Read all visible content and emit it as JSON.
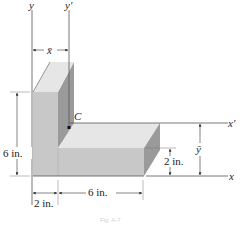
{
  "diagram": {
    "type": "L-shaped composite block centroid figure",
    "axes": {
      "y": "y",
      "y_prime": "y′",
      "x": "x",
      "x_prime": "x′"
    },
    "centroid_label": "C",
    "dimensions": {
      "x_bar": "x̄",
      "y_bar": "ȳ",
      "vertical_height": "6 in.",
      "horizontal_thickness": "2 in.",
      "bottom_left_width": "2 in.",
      "bottom_right_length": "6 in."
    },
    "caption": "Fig. A-7",
    "colors": {
      "front_face": "#c8c8c8",
      "top_face": "#e6e6e6",
      "side_face": "#9a9a9a",
      "line": "#555555",
      "text": "#222222"
    }
  }
}
